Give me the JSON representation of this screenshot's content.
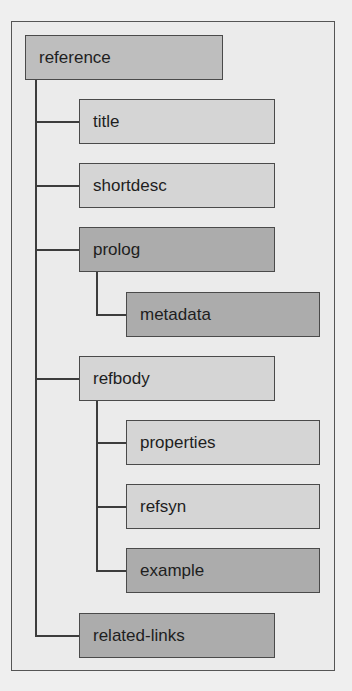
{
  "diagram": {
    "type": "tree",
    "colors": {
      "background": "#efefef",
      "frame": "#ebebeb",
      "root_fill": "#bebebe",
      "light_fill": "#d5d5d5",
      "dark_fill": "#acacac",
      "stroke": "#4a4a4a"
    },
    "root": {
      "label": "reference"
    },
    "nodes": [
      {
        "id": "title",
        "label": "title",
        "level": 1,
        "parent": "reference",
        "fill": "light"
      },
      {
        "id": "shortdesc",
        "label": "shortdesc",
        "level": 1,
        "parent": "reference",
        "fill": "light"
      },
      {
        "id": "prolog",
        "label": "prolog",
        "level": 1,
        "parent": "reference",
        "fill": "dark"
      },
      {
        "id": "metadata",
        "label": "metadata",
        "level": 2,
        "parent": "prolog",
        "fill": "dark"
      },
      {
        "id": "refbody",
        "label": "refbody",
        "level": 1,
        "parent": "reference",
        "fill": "light"
      },
      {
        "id": "properties",
        "label": "properties",
        "level": 2,
        "parent": "refbody",
        "fill": "light"
      },
      {
        "id": "refsyn",
        "label": "refsyn",
        "level": 2,
        "parent": "refbody",
        "fill": "light"
      },
      {
        "id": "example",
        "label": "example",
        "level": 2,
        "parent": "refbody",
        "fill": "dark"
      },
      {
        "id": "related-links",
        "label": "related-links",
        "level": 1,
        "parent": "reference",
        "fill": "dark"
      }
    ]
  }
}
